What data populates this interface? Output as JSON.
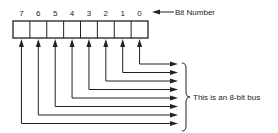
{
  "bits": [
    "7",
    "6",
    "5",
    "4",
    "3",
    "2",
    "1",
    "0"
  ],
  "bit_number_label": "Bit Number",
  "bus_label": "This is an 8-bit bus",
  "colors": {
    "line": "#222222",
    "background": "#ffffff"
  }
}
